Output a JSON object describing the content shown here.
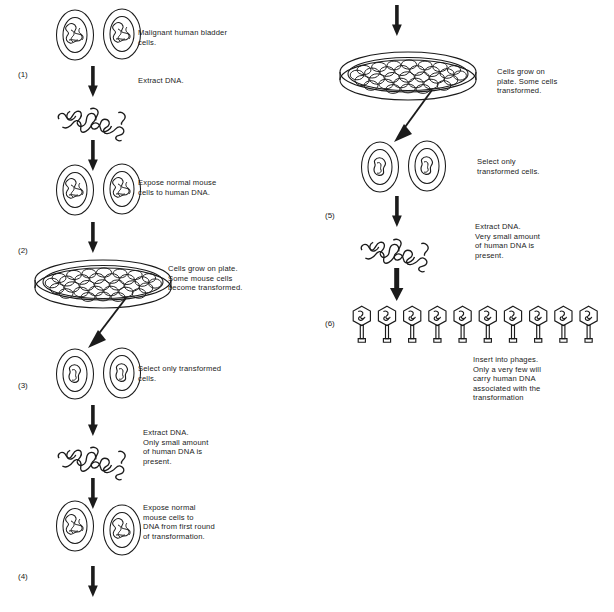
{
  "figure": {
    "type": "biology-flow-diagram",
    "columns": 2,
    "step_count": 6,
    "ink_color": "#1b1b1b",
    "background_color": "#ffffff"
  },
  "left_column": {
    "step_numbers": [
      {
        "id": "step-1",
        "text": "(1)",
        "x": 18,
        "y": 70
      },
      {
        "id": "step-2",
        "text": "(2)",
        "x": 18,
        "y": 246
      },
      {
        "id": "step-3",
        "text": "(3)",
        "x": 18,
        "y": 381
      },
      {
        "id": "step-4",
        "text": "(4)",
        "x": 18,
        "y": 572
      }
    ],
    "labels": [
      {
        "id": "label-malignant-cells",
        "text": "Malignant human bladder\ncells.",
        "x": 138,
        "y": 28
      },
      {
        "id": "label-extract-dna-1",
        "text": "Extract DNA.",
        "x": 138,
        "y": 76
      },
      {
        "id": "label-expose-mouse-human-dna",
        "text": "Expose normal mouse\ncells to human DNA.",
        "x": 138,
        "y": 178
      },
      {
        "id": "label-cells-grow-plate-1",
        "text": "Cells grow on plate.\nSome mouse cells\nbecome transformed.",
        "x": 168,
        "y": 264
      },
      {
        "id": "label-select-transformed-1",
        "text": "Select only transformed\ncells.",
        "x": 138,
        "y": 364
      },
      {
        "id": "label-extract-dna-2",
        "text": "Extract DNA.\nOnly small amount\nof human DNA is\npresent.",
        "x": 143,
        "y": 428
      },
      {
        "id": "label-expose-mouse-first-round",
        "text": "Expose normal\nmouse cells to\nDNA from first round\nof transformation.",
        "x": 143,
        "y": 503
      }
    ],
    "figures": [
      {
        "id": "cell-pair-malignant",
        "kind": "cell-pair",
        "x": 55,
        "y": 8
      },
      {
        "id": "arrow-1",
        "kind": "arrow-down",
        "x": 88,
        "y": 66
      },
      {
        "id": "dna-tangle-1",
        "kind": "dna-tangle",
        "x": 52,
        "y": 98
      },
      {
        "id": "arrow-2",
        "kind": "arrow-down",
        "x": 88,
        "y": 140
      },
      {
        "id": "cell-pair-mouse-1",
        "kind": "cell-pair",
        "x": 55,
        "y": 163
      },
      {
        "id": "arrow-3",
        "kind": "arrow-down",
        "x": 88,
        "y": 222
      },
      {
        "id": "petri-dish-1",
        "kind": "petri-dish",
        "x": 33,
        "y": 258
      },
      {
        "id": "pointer-arrow-1",
        "kind": "pointer-arrow",
        "x": 85,
        "y": 298
      },
      {
        "id": "cell-pair-transformed-1",
        "kind": "cell-pair-transformed",
        "x": 55,
        "y": 347
      },
      {
        "id": "arrow-4",
        "kind": "arrow-down",
        "x": 88,
        "y": 405
      },
      {
        "id": "dna-tangle-2",
        "kind": "dna-tangle",
        "x": 52,
        "y": 437
      },
      {
        "id": "arrow-5",
        "kind": "arrow-down",
        "x": 88,
        "y": 478
      },
      {
        "id": "cell-pair-mouse-2",
        "kind": "cell-pair",
        "x": 55,
        "y": 500
      },
      {
        "id": "arrow-6",
        "kind": "arrow-down",
        "x": 88,
        "y": 562
      }
    ]
  },
  "right_column": {
    "step_numbers": [
      {
        "id": "step-5",
        "text": "(5)",
        "x": 325,
        "y": 211
      },
      {
        "id": "step-6",
        "text": "(6)",
        "x": 325,
        "y": 319
      }
    ],
    "labels": [
      {
        "id": "label-cells-grow-plate-2",
        "text": "Cells grow on\nplate. Some cells\ntransformed.",
        "x": 497,
        "y": 67
      },
      {
        "id": "label-select-transformed-2",
        "text": "Select only\ntransformed cells.",
        "x": 477,
        "y": 157
      },
      {
        "id": "label-extract-dna-3",
        "text": "Extract DNA.\nVery small amount\nof human DNA is\npresent.",
        "x": 475,
        "y": 222
      },
      {
        "id": "label-insert-phages",
        "text": "Insert into phages.\nOnly a very few will\ncarry human DNA\nassociated with the\ntransformation",
        "x": 473,
        "y": 355
      }
    ],
    "figures": [
      {
        "id": "arrow-7",
        "kind": "arrow-down",
        "x": 392,
        "y": 5
      },
      {
        "id": "petri-dish-2",
        "kind": "petri-dish",
        "x": 338,
        "y": 50
      },
      {
        "id": "pointer-arrow-2",
        "kind": "pointer-arrow",
        "x": 390,
        "y": 88
      },
      {
        "id": "cell-pair-transformed-2",
        "kind": "cell-pair-transformed",
        "x": 360,
        "y": 140
      },
      {
        "id": "arrow-8",
        "kind": "arrow-down",
        "x": 392,
        "y": 196
      },
      {
        "id": "dna-tangle-3",
        "kind": "dna-tangle",
        "x": 355,
        "y": 229
      },
      {
        "id": "arrow-9",
        "kind": "arrow-down",
        "x": 392,
        "y": 270
      },
      {
        "id": "phage-row",
        "kind": "phage-row",
        "x": 351,
        "y": 305,
        "count": 10
      }
    ]
  }
}
